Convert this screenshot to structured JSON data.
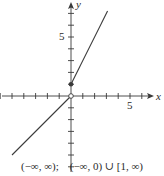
{
  "chart_data": {
    "type": "line",
    "title": "",
    "xlabel": "x",
    "ylabel": "y",
    "xlim": [
      -6,
      7
    ],
    "ylim": [
      -6,
      8
    ],
    "grid": false,
    "x_ticks": [
      -6,
      -5,
      -4,
      -3,
      -2,
      -1,
      1,
      2,
      3,
      4,
      5,
      6
    ],
    "y_ticks": [
      -6,
      -5,
      -4,
      -3,
      -2,
      -1,
      1,
      2,
      3,
      4,
      5,
      6,
      7
    ],
    "x_tick_labels": [
      {
        "value": 5,
        "label": "5"
      }
    ],
    "y_tick_labels": [
      {
        "value": 5,
        "label": "5"
      }
    ],
    "series": [
      {
        "name": "f(x) = x, x < 0",
        "x": [
          -5,
          0
        ],
        "y": [
          -5,
          0
        ],
        "endpoint": {
          "x": 0,
          "y": 0,
          "style": "open"
        }
      },
      {
        "name": "f(x) = 2x + 1, x >= 0",
        "x": [
          0,
          3.1
        ],
        "y": [
          1,
          7.2
        ],
        "endpoint": {
          "x": 0,
          "y": 1,
          "style": "closed"
        }
      }
    ],
    "annotations": [
      "(−∞, ∞);",
      "(−∞, 0) ∪ [1, ∞)"
    ]
  },
  "axes": {
    "x_label": "x",
    "y_label": "y",
    "x_tick_5": "5",
    "y_tick_5": "5"
  },
  "caption": {
    "domain": "(−∞, ∞);",
    "range": "(−∞, 0) ∪ [1, ∞)"
  },
  "colors": {
    "axis": "#3a3a3a",
    "line": "#3a3a3a",
    "background": "#ffffff"
  }
}
